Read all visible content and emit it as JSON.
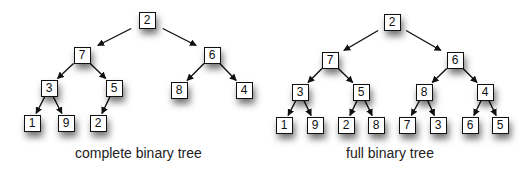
{
  "diagrams": [
    {
      "id": "complete",
      "caption": "complete binary tree",
      "caption_pos": [
        75,
        145
      ],
      "nodes": [
        {
          "label": "2",
          "x": 147,
          "y": 20
        },
        {
          "label": "7",
          "x": 82,
          "y": 55
        },
        {
          "label": "6",
          "x": 212,
          "y": 55
        },
        {
          "label": "3",
          "x": 49,
          "y": 88
        },
        {
          "label": "5",
          "x": 114,
          "y": 88
        },
        {
          "label": "8",
          "x": 179,
          "y": 90
        },
        {
          "label": "4",
          "x": 244,
          "y": 90
        },
        {
          "label": "1",
          "x": 32,
          "y": 123
        },
        {
          "label": "9",
          "x": 66,
          "y": 123
        },
        {
          "label": "2",
          "x": 98,
          "y": 123
        }
      ],
      "edges": [
        [
          0,
          1
        ],
        [
          0,
          2
        ],
        [
          1,
          3
        ],
        [
          1,
          4
        ],
        [
          2,
          5
        ],
        [
          2,
          6
        ],
        [
          3,
          7
        ],
        [
          3,
          8
        ],
        [
          4,
          9
        ]
      ]
    },
    {
      "id": "full",
      "caption": "full binary tree",
      "caption_pos": [
        346,
        145
      ],
      "nodes": [
        {
          "label": "2",
          "x": 392,
          "y": 22
        },
        {
          "label": "7",
          "x": 330,
          "y": 60
        },
        {
          "label": "6",
          "x": 455,
          "y": 60
        },
        {
          "label": "3",
          "x": 300,
          "y": 92
        },
        {
          "label": "5",
          "x": 361,
          "y": 92
        },
        {
          "label": "8",
          "x": 424,
          "y": 92
        },
        {
          "label": "4",
          "x": 485,
          "y": 92
        },
        {
          "label": "1",
          "x": 284,
          "y": 125
        },
        {
          "label": "9",
          "x": 315,
          "y": 125
        },
        {
          "label": "2",
          "x": 346,
          "y": 125
        },
        {
          "label": "8",
          "x": 376,
          "y": 125
        },
        {
          "label": "7",
          "x": 407,
          "y": 125
        },
        {
          "label": "3",
          "x": 438,
          "y": 125
        },
        {
          "label": "6",
          "x": 470,
          "y": 125
        },
        {
          "label": "5",
          "x": 500,
          "y": 125
        }
      ],
      "edges": [
        [
          0,
          1
        ],
        [
          0,
          2
        ],
        [
          1,
          3
        ],
        [
          1,
          4
        ],
        [
          2,
          5
        ],
        [
          2,
          6
        ],
        [
          3,
          7
        ],
        [
          3,
          8
        ],
        [
          4,
          9
        ],
        [
          4,
          10
        ],
        [
          5,
          11
        ],
        [
          5,
          12
        ],
        [
          6,
          13
        ],
        [
          6,
          14
        ]
      ]
    }
  ]
}
